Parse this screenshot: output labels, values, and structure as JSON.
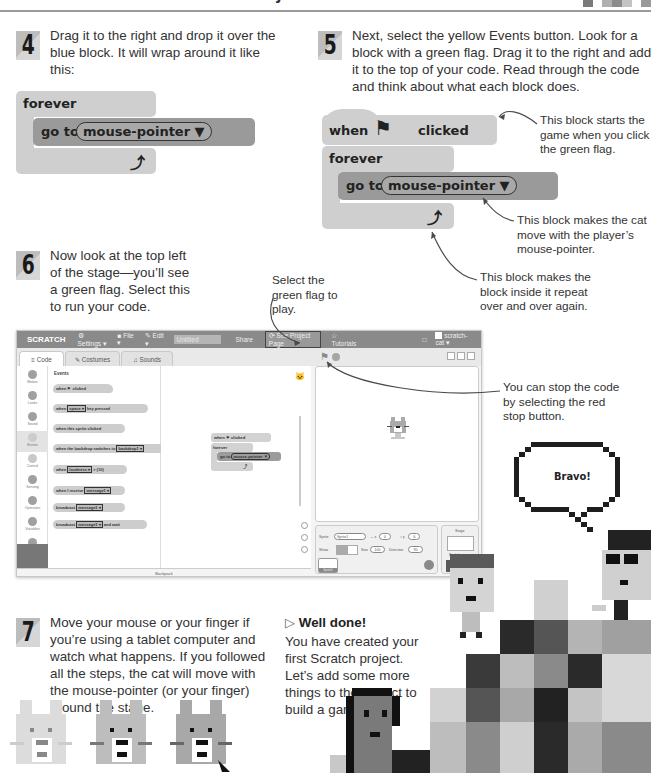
{
  "header": {
    "title": "GAME PROJECT"
  },
  "steps": [
    {
      "number": "4",
      "text": "Drag it to the right and drop it over the blue block. It will wrap around it like this:"
    },
    {
      "number": "5",
      "text": "Next, select the yellow Events button. Look for a block with a green flag. Drag it to the right and add it to the top of your code. Read through the code and think about what each block does."
    },
    {
      "number": "6",
      "text": "Now look at the top left of the stage—you’ll see a green flag. Select this to run your code."
    },
    {
      "number": "7",
      "text": "Move your mouse or your finger if you’re using a tablet computer and watch what happens. If you followed all the steps, the cat will move with the mouse-pointer (or your finger) around the stage."
    }
  ],
  "blocks": {
    "forever": "forever",
    "go_to": "go to",
    "mouse_pointer": "mouse-pointer ▼",
    "when": "when",
    "clicked": "clicked"
  },
  "annotations": {
    "starts_game": "This block starts the game when you click the green flag.",
    "moves_cat": "This block makes the cat move with the player’s mouse-pointer.",
    "repeat": "This block makes the block inside it repeat over and over again.",
    "green_flag": "Select the green flag to play.",
    "stop": "You can stop the code by selecting the red stop button."
  },
  "app": {
    "logo": "SCRATCH",
    "menu": [
      "Settings ▾",
      "File ▾",
      "Edit ▾"
    ],
    "project_title": "Untitled",
    "share": "Share",
    "see_project_page": "See Project Page",
    "tutorials": "Tutorials",
    "user": "scratch-cat ▾",
    "tabs": [
      "Code",
      "Costumes",
      "Sounds"
    ],
    "categories": [
      "Motion",
      "Looks",
      "Sound",
      "Events",
      "Control",
      "Sensing",
      "Operators",
      "Variables",
      "My Blocks"
    ],
    "palette_heading": "Events",
    "palette_blocks": [
      {
        "pre": "when ⚑ clicked",
        "dd": "",
        "post": ""
      },
      {
        "pre": "when",
        "dd": "space ▾",
        "post": "key pressed"
      },
      {
        "pre": "when this sprite clicked",
        "dd": "",
        "post": ""
      },
      {
        "pre": "when the backdrop switches to",
        "dd": "backdrop1 ▾",
        "post": ""
      },
      {
        "pre": "when",
        "dd": "loudness ▾",
        "post": "> (10)"
      },
      {
        "pre": "when I receive",
        "dd": "message1 ▾",
        "post": ""
      },
      {
        "pre": "broadcast",
        "dd": "message1 ▾",
        "post": ""
      },
      {
        "pre": "broadcast",
        "dd": "message1 ▾",
        "post": "and wait"
      }
    ],
    "backpack": "Backpack",
    "sprite_info": {
      "sprite_label": "Sprite",
      "sprite_name": "Sprite1",
      "x_label": "↔ x",
      "x_value": "0",
      "y_label": "↕ y",
      "y_value": "-6",
      "show_label": "Show",
      "size_label": "Size",
      "size_value": "100",
      "direction_label": "Direction",
      "direction_value": "90",
      "thumb_label": "Sprite1"
    },
    "stage_panel": {
      "label": "Stage",
      "backdrops_label": "Backdrops",
      "backdrops_count": "1"
    }
  },
  "bubble": {
    "text": "Bravo!"
  },
  "well_done": {
    "heading": "Well done!",
    "text": "You have created your first Scratch project. Let’s add some more things to the project to build a game."
  },
  "colors": {
    "block_light": "#cfcfcf",
    "block_dark": "#9a9a9a",
    "menubar": "#8a8a8a"
  }
}
